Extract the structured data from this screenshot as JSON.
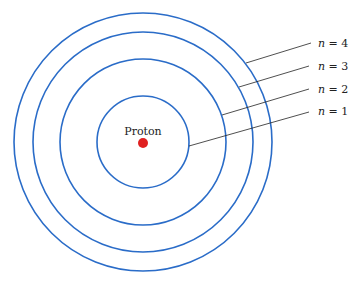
{
  "diagram": {
    "nucleus": {
      "label": "Proton",
      "color": "#e02020",
      "cx": 143,
      "cy": 142,
      "r": 5
    },
    "orbit_color": "#2a6cc8",
    "orbits": [
      {
        "n": 1,
        "label": "n = 1",
        "r": 46
      },
      {
        "n": 2,
        "label": "n = 2",
        "r": 83
      },
      {
        "n": 3,
        "label": "n = 3",
        "r": 110
      },
      {
        "n": 4,
        "label": "n = 4",
        "r": 129
      }
    ],
    "labels": [
      {
        "text": "n = 1",
        "var": "n",
        "rest": " = 1"
      },
      {
        "text": "n = 2",
        "var": "n",
        "rest": " = 2"
      },
      {
        "text": "n = 3",
        "var": "n",
        "rest": " = 3"
      },
      {
        "text": "n = 4",
        "var": "n",
        "rest": " = 4"
      }
    ]
  }
}
